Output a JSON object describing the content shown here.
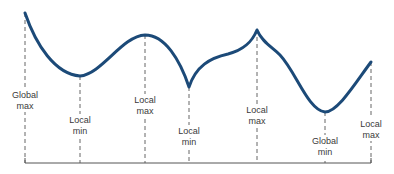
{
  "diagram": {
    "type": "function-extrema",
    "curve_color": "#1c4a78",
    "guide_color": "#555555",
    "axis_color": "#555555",
    "baseline": {
      "y": 163,
      "x_start": 25,
      "x_end": 371
    },
    "points": [
      {
        "id": "p1",
        "x": 25,
        "y": 13,
        "label_line1": "Global",
        "label_line2": "max",
        "label_y": 89
      },
      {
        "id": "p2",
        "x": 80,
        "y": 76,
        "label_line1": "Local",
        "label_line2": "min",
        "label_y": 114
      },
      {
        "id": "p3",
        "x": 145,
        "y": 35,
        "label_line1": "Local",
        "label_line2": "max",
        "label_y": 94
      },
      {
        "id": "p4",
        "x": 189,
        "y": 87,
        "label_line1": "Local",
        "label_line2": "min",
        "label_y": 125
      },
      {
        "id": "p5",
        "x": 257,
        "y": 30,
        "label_line1": "Local",
        "label_line2": "max",
        "label_y": 104
      },
      {
        "id": "p6",
        "x": 325,
        "y": 112,
        "label_line1": "Global",
        "label_line2": "min",
        "label_y": 135
      },
      {
        "id": "p7",
        "x": 371,
        "y": 62,
        "label_line1": "Local",
        "label_line2": "max",
        "label_y": 118
      }
    ]
  }
}
